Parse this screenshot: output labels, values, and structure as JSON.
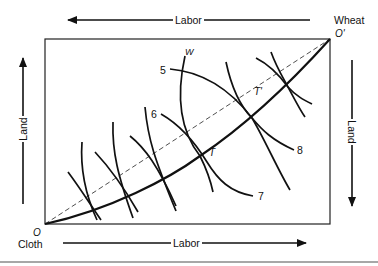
{
  "diagram": {
    "type": "edgeworth-box",
    "top_axis": {
      "label": "Labor",
      "direction": "left"
    },
    "bottom_axis": {
      "label": "Labor",
      "direction": "right"
    },
    "left_axis": {
      "label": "Land",
      "direction": "up"
    },
    "right_axis": {
      "label": "Land",
      "direction": "down"
    },
    "origins": {
      "cloth": {
        "symbol": "O",
        "good": "Cloth"
      },
      "wheat": {
        "symbol": "O'",
        "good": "Wheat"
      }
    },
    "curve_labels": {
      "wheat_isoquant": "W",
      "isoquants": [
        "5",
        "6",
        "7",
        "8"
      ]
    },
    "points": {
      "T": "T",
      "T_prime": "T'"
    },
    "colors": {
      "line": "#111111",
      "rule": "#8a8a8a",
      "background": "#ffffff"
    }
  }
}
